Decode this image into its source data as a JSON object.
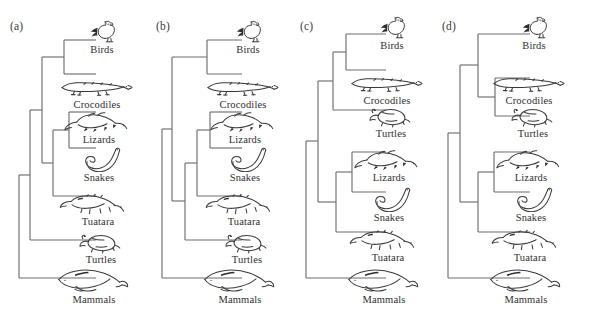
{
  "figure": {
    "type": "phylogenetic-cladogram-set",
    "background": "#ffffff",
    "line_color": "#6e6e6e",
    "text_color": "#2f2f2f",
    "panel_count": 4
  },
  "panels": [
    {
      "id": "a",
      "label": "(a)",
      "left": 6,
      "tip_x": 90,
      "taxa": [
        {
          "name": "Birds",
          "art": "bird-rooster-icon",
          "tip_y": 40,
          "label_y": 58,
          "art_x": 96,
          "art_y": 18
        },
        {
          "name": "Crocodiles",
          "art": "crocodile-icon",
          "tip_y": 74,
          "label_y": 96,
          "art_x": 91,
          "art_y": 73
        },
        {
          "name": "Lizards",
          "art": "lizard-icon",
          "tip_y": 112,
          "label_y": 134,
          "art_x": 93,
          "art_y": 108
        },
        {
          "name": "Snakes",
          "art": "snake-icon",
          "tip_y": 148,
          "label_y": 172,
          "art_x": 93,
          "art_y": 146
        },
        {
          "name": "Tuatara",
          "art": "tuatara-icon",
          "tip_y": 196,
          "label_y": 218,
          "art_x": 92,
          "art_y": 190
        },
        {
          "name": "Turtles",
          "art": "turtle-icon",
          "tip_y": 240,
          "label_y": 256,
          "art_x": 95,
          "art_y": 228
        },
        {
          "name": "Mammals",
          "art": "whale-mammal-icon",
          "tip_y": 278,
          "label_y": 296,
          "art_x": 88,
          "art_y": 264
        }
      ],
      "nodes": [
        {
          "name": "birds-crocodiles",
          "x": 58,
          "y_top": 40,
          "y_bot": 74
        },
        {
          "name": "lizards-snakes",
          "x": 63,
          "y_top": 112,
          "y_bot": 148
        },
        {
          "name": "squamata-tuatara",
          "x": 47,
          "y_top": 130,
          "y_bot": 196
        },
        {
          "name": "diapsid-clade",
          "x": 36,
          "y_top": 57,
          "y_bot": 163
        },
        {
          "name": "turtles-reptiles",
          "x": 24,
          "y_top": 110,
          "y_bot": 240
        },
        {
          "name": "root",
          "x": 13,
          "y_top": 175,
          "y_bot": 278
        }
      ]
    },
    {
      "id": "b",
      "label": "(b)",
      "left": 152,
      "tip_x": 90,
      "taxa": [
        {
          "name": "Birds",
          "art": "bird-rooster-icon",
          "tip_y": 40,
          "label_y": 58,
          "art_x": 96,
          "art_y": 18
        },
        {
          "name": "Crocodiles",
          "art": "crocodile-icon",
          "tip_y": 74,
          "label_y": 96,
          "art_x": 91,
          "art_y": 73
        },
        {
          "name": "Lizards",
          "art": "lizard-icon",
          "tip_y": 112,
          "label_y": 134,
          "art_x": 93,
          "art_y": 108
        },
        {
          "name": "Snakes",
          "art": "snake-icon",
          "tip_y": 148,
          "label_y": 172,
          "art_x": 93,
          "art_y": 146
        },
        {
          "name": "Tuatara",
          "art": "tuatara-icon",
          "tip_y": 196,
          "label_y": 218,
          "art_x": 92,
          "art_y": 190
        },
        {
          "name": "Turtles",
          "art": "turtle-icon",
          "tip_y": 240,
          "label_y": 256,
          "art_x": 95,
          "art_y": 228
        },
        {
          "name": "Mammals",
          "art": "whale-mammal-icon",
          "tip_y": 278,
          "label_y": 296,
          "art_x": 88,
          "art_y": 264
        }
      ],
      "nodes": [
        {
          "name": "birds-crocodiles",
          "x": 55,
          "y_top": 40,
          "y_bot": 74
        },
        {
          "name": "lizards-snakes",
          "x": 58,
          "y_top": 112,
          "y_bot": 148
        },
        {
          "name": "squamata-tuatara",
          "x": 45,
          "y_top": 130,
          "y_bot": 196
        },
        {
          "name": "lepidosaur-turtle",
          "x": 33,
          "y_top": 163,
          "y_bot": 240
        },
        {
          "name": "reptile-clade",
          "x": 20,
          "y_top": 57,
          "y_bot": 201
        },
        {
          "name": "root",
          "x": 10,
          "y_top": 129,
          "y_bot": 278
        }
      ]
    },
    {
      "id": "c",
      "label": "(c)",
      "left": 296,
      "tip_x": 90,
      "taxa": [
        {
          "name": "Birds",
          "art": "bird-rooster-icon",
          "tip_y": 34,
          "label_y": 54,
          "art_x": 96,
          "art_y": 14
        },
        {
          "name": "Crocodiles",
          "art": "crocodile-icon",
          "tip_y": 70,
          "label_y": 92,
          "art_x": 91,
          "art_y": 69
        },
        {
          "name": "Turtles",
          "art": "turtle-icon",
          "tip_y": 110,
          "label_y": 132,
          "art_x": 95,
          "art_y": 102
        },
        {
          "name": "Lizards",
          "art": "lizard-icon",
          "tip_y": 152,
          "label_y": 172,
          "art_x": 93,
          "art_y": 146
        },
        {
          "name": "Snakes",
          "art": "snake-icon",
          "tip_y": 192,
          "label_y": 212,
          "art_x": 93,
          "art_y": 186
        },
        {
          "name": "Tuatara",
          "art": "tuatara-icon",
          "tip_y": 232,
          "label_y": 254,
          "art_x": 92,
          "art_y": 226
        },
        {
          "name": "Mammals",
          "art": "whale-mammal-icon",
          "tip_y": 278,
          "label_y": 296,
          "art_x": 88,
          "art_y": 264
        }
      ],
      "nodes": [
        {
          "name": "birds-crocodiles",
          "x": 50,
          "y_top": 34,
          "y_bot": 70
        },
        {
          "name": "archosaur-turtle",
          "x": 37,
          "y_top": 52,
          "y_bot": 110
        },
        {
          "name": "lizards-snakes",
          "x": 56,
          "y_top": 152,
          "y_bot": 192
        },
        {
          "name": "squamata-tuatara",
          "x": 40,
          "y_top": 172,
          "y_bot": 232
        },
        {
          "name": "reptile-clade",
          "x": 22,
          "y_top": 81,
          "y_bot": 202
        },
        {
          "name": "root",
          "x": 10,
          "y_top": 141,
          "y_bot": 278
        }
      ]
    },
    {
      "id": "d",
      "label": "(d)",
      "left": 438,
      "tip_x": 92,
      "taxa": [
        {
          "name": "Birds",
          "art": "bird-rooster-icon",
          "tip_y": 34,
          "label_y": 54,
          "art_x": 96,
          "art_y": 14
        },
        {
          "name": "Crocodiles",
          "art": "crocodile-icon",
          "tip_y": 78,
          "label_y": 92,
          "art_x": 91,
          "art_y": 69
        },
        {
          "name": "Turtles",
          "art": "turtle-icon",
          "tip_y": 116,
          "label_y": 132,
          "art_x": 95,
          "art_y": 102
        },
        {
          "name": "Lizards",
          "art": "lizard-icon",
          "tip_y": 152,
          "label_y": 172,
          "art_x": 93,
          "art_y": 146
        },
        {
          "name": "Snakes",
          "art": "snake-icon",
          "tip_y": 192,
          "label_y": 212,
          "art_x": 93,
          "art_y": 186
        },
        {
          "name": "Tuatara",
          "art": "tuatara-icon",
          "tip_y": 232,
          "label_y": 254,
          "art_x": 92,
          "art_y": 226
        },
        {
          "name": "Mammals",
          "art": "whale-mammal-icon",
          "tip_y": 278,
          "label_y": 296,
          "art_x": 88,
          "art_y": 264
        }
      ],
      "nodes": [
        {
          "name": "crocodiles-turtles",
          "x": 57,
          "y_top": 78,
          "y_bot": 116
        },
        {
          "name": "archosaur-clade",
          "x": 40,
          "y_top": 34,
          "y_bot": 97
        },
        {
          "name": "lizards-snakes",
          "x": 56,
          "y_top": 152,
          "y_bot": 192
        },
        {
          "name": "squamata-tuatara",
          "x": 40,
          "y_top": 172,
          "y_bot": 232
        },
        {
          "name": "reptile-clade",
          "x": 22,
          "y_top": 65,
          "y_bot": 202
        },
        {
          "name": "root",
          "x": 10,
          "y_top": 133,
          "y_bot": 278
        }
      ]
    }
  ]
}
